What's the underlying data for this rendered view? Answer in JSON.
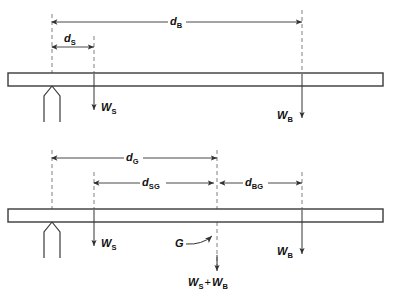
{
  "figure": {
    "colors": {
      "line": "#3a3a3a",
      "beam_outline": "#3a3a3a",
      "dashed": "#777777",
      "text": "#111111",
      "background": "#ffffff"
    },
    "diagrams": [
      {
        "id": "upper",
        "name": "upper-diagram",
        "beam": {
          "x": 8,
          "y": 73,
          "width": 375,
          "height": 13
        },
        "support": {
          "x": 52,
          "y": 86,
          "label": "knife-edge-support"
        },
        "dimensions": [
          {
            "name": "d-B",
            "label": "d",
            "subscript": "B",
            "from_x": 52,
            "to_x": 302,
            "y": 22
          },
          {
            "name": "d-S",
            "label": "d",
            "subscript": "S",
            "from_x": 52,
            "to_x": 94,
            "y": 47
          }
        ],
        "forces": [
          {
            "name": "force-WS",
            "label": "W",
            "subscript": "S",
            "x": 94,
            "from_y": 73,
            "to_y": 112,
            "label_side": "right"
          },
          {
            "name": "force-WB",
            "label": "W",
            "subscript": "B",
            "x": 302,
            "from_y": 73,
            "to_y": 120,
            "label_side": "left"
          }
        ],
        "extension_lines": [
          {
            "x": 52,
            "from_y": 14,
            "to_y": 73
          },
          {
            "x": 94,
            "from_y": 36,
            "to_y": 73
          },
          {
            "x": 302,
            "from_y": 10,
            "to_y": 73
          }
        ]
      },
      {
        "id": "lower",
        "name": "lower-diagram",
        "beam": {
          "x": 8,
          "y": 209,
          "width": 375,
          "height": 13
        },
        "support": {
          "x": 52,
          "y": 222,
          "label": "knife-edge-support"
        },
        "dimensions": [
          {
            "name": "d-G",
            "label": "d",
            "subscript": "G",
            "from_x": 52,
            "to_x": 217,
            "y": 158
          },
          {
            "name": "d-SG",
            "label": "d",
            "subscript": "SG",
            "from_x": 94,
            "to_x": 217,
            "y": 183
          },
          {
            "name": "d-BG",
            "label": "d",
            "subscript": "BG",
            "from_x": 217,
            "to_x": 302,
            "y": 183
          }
        ],
        "forces": [
          {
            "name": "force-WS",
            "label": "W",
            "subscript": "S",
            "x": 94,
            "from_y": 209,
            "to_y": 248,
            "label_side": "right"
          },
          {
            "name": "force-WB",
            "label": "W",
            "subscript": "B",
            "x": 302,
            "from_y": 209,
            "to_y": 256,
            "label_side": "left"
          },
          {
            "name": "force-WS-plus-WB",
            "label": "W",
            "subscript": "S",
            "operator": "+",
            "label2": "W",
            "subscript2": "B",
            "x": 217,
            "from_y": 209,
            "to_y": 268,
            "label_side": "below"
          }
        ],
        "extension_lines": [
          {
            "x": 52,
            "from_y": 150,
            "to_y": 209
          },
          {
            "x": 94,
            "from_y": 172,
            "to_y": 209
          },
          {
            "x": 217,
            "from_y": 150,
            "to_y": 209
          },
          {
            "x": 302,
            "from_y": 172,
            "to_y": 209
          }
        ],
        "centroid": {
          "name": "centroid-marker",
          "label": "G",
          "label_x": 178,
          "label_y": 243,
          "target_x": 215,
          "target_y": 238
        }
      }
    ]
  },
  "labels": {
    "d_B": "d",
    "d_B_sub": "B",
    "d_S": "d",
    "d_S_sub": "S",
    "d_G": "d",
    "d_G_sub": "G",
    "d_SG": "d",
    "d_SG_sub": "SG",
    "d_BG": "d",
    "d_BG_sub": "BG",
    "W_S": "W",
    "W_S_sub": "S",
    "W_B": "W",
    "W_B_sub": "B",
    "W_sum_first": "W",
    "W_sum_first_sub": "S",
    "W_sum_op": "+",
    "W_sum_second": "W",
    "W_sum_second_sub": "B",
    "G": "G"
  }
}
